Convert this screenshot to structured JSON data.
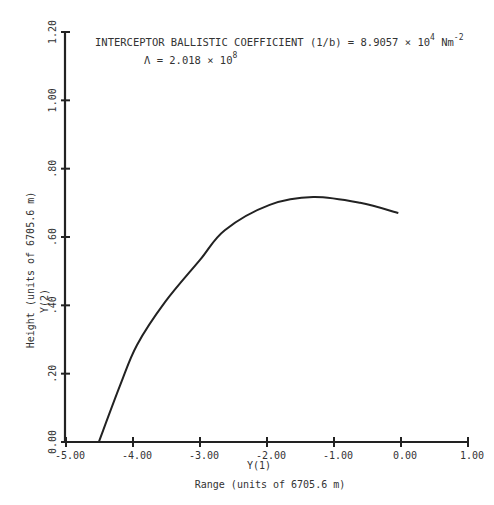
{
  "chart_data": {
    "type": "line",
    "annotations": [
      {
        "text_main": "INTERCEPTOR BALLISTIC COEFFICIENT (1/b) = 8.9057 × 10",
        "exp": "4",
        "unit": " Nm",
        "unit_exp": "-2"
      },
      {
        "text_main": "Λ = 2.018 × 10",
        "exp": "8"
      }
    ],
    "xlabel": "Range (units of 6705.6 m)",
    "xlabel_var": "Y(1)",
    "ylabel": "Height (units of 6705.6 m)",
    "ylabel_var": "Y(2)",
    "xlim": [
      -5.0,
      1.0
    ],
    "ylim": [
      0.0,
      1.2
    ],
    "xticks": [
      "-5.00",
      "-4.00",
      "-3.00",
      "-2.00",
      "-1.00",
      "0.00",
      "1.00"
    ],
    "yticks": [
      "0.00",
      ".20",
      ".40",
      ".60",
      ".80",
      "1.00",
      "1.20"
    ],
    "grid": false,
    "series": [
      {
        "name": "trajectory",
        "x": [
          -4.51,
          -4.19,
          -3.94,
          -3.52,
          -3.0,
          -2.63,
          -1.96,
          -1.31,
          -0.61,
          -0.04
        ],
        "y": [
          0.0,
          0.167,
          0.284,
          0.41,
          0.533,
          0.62,
          0.694,
          0.717,
          0.7,
          0.67
        ]
      }
    ]
  }
}
